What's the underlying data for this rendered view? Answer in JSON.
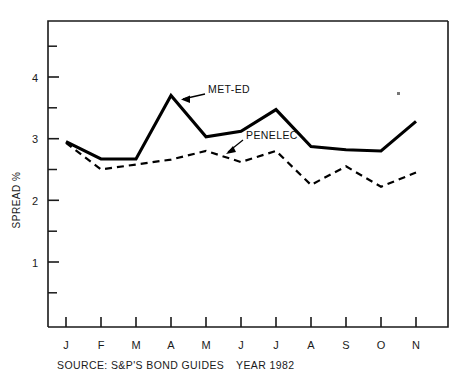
{
  "chart_data": {
    "type": "line",
    "title": "",
    "xlabel": "YEAR 1982",
    "ylabel": "SPREAD %",
    "categories": [
      "J",
      "F",
      "M",
      "A",
      "M",
      "J",
      "J",
      "A",
      "S",
      "O",
      "N"
    ],
    "xlim": [
      -0.5,
      10.9
    ],
    "ylim": [
      0,
      4.9
    ],
    "yticks": [
      1,
      2,
      3,
      4
    ],
    "ytick_labels": [
      "1",
      "2",
      "3",
      "4"
    ],
    "yminor_step": 0.5,
    "grid": false,
    "legend": "inline-annotations",
    "series": [
      {
        "name": "MET-ED",
        "style": "solid",
        "color": "#000000",
        "values": [
          2.95,
          2.67,
          2.67,
          3.7,
          3.03,
          3.12,
          3.47,
          2.87,
          2.82,
          2.8,
          3.28
        ]
      },
      {
        "name": "PENELEC",
        "style": "dashed",
        "color": "#000000",
        "values": [
          2.93,
          2.5,
          2.58,
          2.66,
          2.8,
          2.62,
          2.8,
          2.25,
          2.55,
          2.22,
          2.45
        ]
      }
    ],
    "annotations": [
      {
        "text": "MET-ED",
        "points_to_series": "MET-ED",
        "points_to_index": 3
      },
      {
        "text": "PENELEC",
        "points_to_series": "PENELEC",
        "points_to_index": 4
      }
    ],
    "source": "SOURCE: S&P'S BOND GUIDES",
    "year_label": "YEAR 1982"
  },
  "axis": {
    "y_title": "SPREAD %",
    "y_tick_1": "1",
    "y_tick_2": "2",
    "y_tick_3": "3",
    "y_tick_4": "4",
    "x_tick_0": "J",
    "x_tick_1": "F",
    "x_tick_2": "M",
    "x_tick_3": "A",
    "x_tick_4": "M",
    "x_tick_5": "J",
    "x_tick_6": "J",
    "x_tick_7": "A",
    "x_tick_8": "S",
    "x_tick_9": "O",
    "x_tick_10": "N"
  },
  "labels": {
    "met_ed": "MET-ED",
    "penelec": "PENELEC"
  },
  "footer": {
    "source": "SOURCE: S&P'S BOND GUIDES",
    "year": "YEAR 1982"
  }
}
